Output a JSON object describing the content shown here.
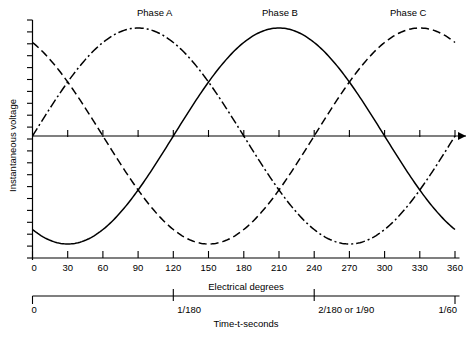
{
  "chart_data": {
    "type": "line",
    "title": "",
    "xlabel": "Electrical degrees",
    "ylabel": "Instantaneous voltage",
    "secondary_xlabel": "Time-t-seconds",
    "x": [
      0,
      30,
      60,
      90,
      120,
      150,
      180,
      210,
      240,
      270,
      300,
      330,
      360
    ],
    "xlim": [
      0,
      360
    ],
    "ylim": [
      -1.15,
      1.15
    ],
    "xticks": [
      "0",
      "30",
      "60",
      "90",
      "120",
      "150",
      "180",
      "210",
      "240",
      "270",
      "300",
      "330",
      "360"
    ],
    "yticks_labeled": false,
    "grid": false,
    "legend_position": "inline-above-peaks",
    "series": [
      {
        "name": "Phase A",
        "label": "Phase A",
        "linestyle": "dashdot",
        "color": "#000000",
        "phase_deg": 0,
        "amplitude": 1,
        "peak_at_deg": 90,
        "values": [
          0.0,
          0.5,
          0.866,
          1.0,
          0.866,
          0.5,
          0.0,
          -0.5,
          -0.866,
          -1.0,
          -0.866,
          -0.5,
          0.0
        ]
      },
      {
        "name": "Phase B",
        "label": "Phase B",
        "linestyle": "solid",
        "color": "#000000",
        "phase_deg": -120,
        "amplitude": 1,
        "peak_at_deg": 210,
        "values": [
          -0.866,
          -1.0,
          -0.866,
          -0.5,
          0.0,
          0.5,
          0.866,
          1.0,
          0.866,
          0.5,
          0.0,
          -0.5,
          -0.866
        ]
      },
      {
        "name": "Phase C",
        "label": "Phase C",
        "linestyle": "dashed",
        "color": "#000000",
        "phase_deg": 120,
        "amplitude": 1,
        "peak_at_deg": 330,
        "values": [
          0.866,
          0.5,
          0.0,
          -0.5,
          -0.866,
          -1.0,
          -0.866,
          -0.5,
          0.0,
          0.5,
          0.866,
          1.0,
          0.866
        ]
      }
    ],
    "time_axis": {
      "label": "Time-t-seconds",
      "ticks": [
        {
          "value": 0,
          "label": "0",
          "x_deg": 0
        },
        {
          "value": 0.005555,
          "label": "1/180",
          "x_deg": 120
        },
        {
          "value": 0.011111,
          "label": "2/180 or 1/90",
          "x_deg": 240
        },
        {
          "value": 0.016666,
          "label": "1/60",
          "x_deg": 360
        }
      ]
    }
  },
  "labels": {
    "phase_a": "Phase A",
    "phase_b": "Phase B",
    "phase_c": "Phase C",
    "y_axis_title": "Instantaneous voltage",
    "x_axis_title": "Electrical degrees",
    "time_axis_title": "Time-t-seconds"
  },
  "x_tick_labels": [
    "0",
    "30",
    "60",
    "90",
    "120",
    "150",
    "180",
    "210",
    "240",
    "270",
    "300",
    "330",
    "360"
  ],
  "time_tick_labels": [
    "0",
    "1/180",
    "2/180 or 1/90",
    "1/60"
  ],
  "colors": {
    "ink": "#000000",
    "background": "#ffffff"
  }
}
